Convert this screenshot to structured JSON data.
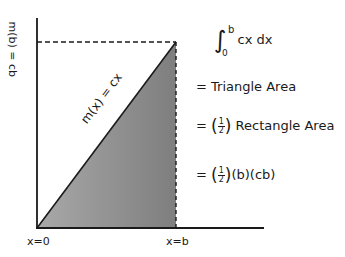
{
  "diagram": {
    "axes": {
      "y_label": "m(b) = cb",
      "x_start_label": "x=0",
      "x_end_label": "x=b"
    },
    "line_label": "m(x) = cx",
    "equations": {
      "integral": {
        "upper": "b",
        "lower": "0",
        "integrand": "cx dx"
      },
      "line1": "= Triangle Area",
      "line2_prefix": "=",
      "line2_frac_num": "1",
      "line2_frac_den": "2",
      "line2_suffix": "Rectangle Area",
      "line3_prefix": "=",
      "line3_frac_num": "1",
      "line3_frac_den": "2",
      "line3_suffix": "(b)(cb)"
    },
    "colors": {
      "ink": "#1a1a1a",
      "shade": "#8a8a8a"
    }
  }
}
